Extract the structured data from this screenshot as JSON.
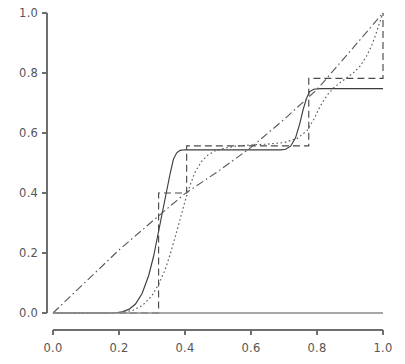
{
  "chart_data": {
    "type": "line",
    "title": "",
    "xlabel": "",
    "ylabel": "",
    "xlim": [
      0.0,
      1.0
    ],
    "ylim": [
      0.0,
      1.0
    ],
    "grid": false,
    "legend": "none",
    "xticks": [
      "0.0",
      "0.2",
      "0.4",
      "0.6",
      "0.8",
      "1.0"
    ],
    "xtick_values": [
      0.0,
      0.2,
      0.4,
      0.6,
      0.8,
      1.0
    ],
    "yticks": [
      "0.0",
      "0.2",
      "0.4",
      "0.6",
      "0.8",
      "1.0"
    ],
    "ytick_values": [
      0.0,
      0.2,
      0.4,
      0.6,
      0.8,
      1.0
    ],
    "series": [
      {
        "name": "smoothed-step-curve",
        "style": "solid",
        "color": "#3c3c3c",
        "points": [
          [
            0.0,
            0.0
          ],
          [
            0.05,
            0.0
          ],
          [
            0.1,
            0.0
          ],
          [
            0.15,
            0.0
          ],
          [
            0.19,
            0.001
          ],
          [
            0.21,
            0.004
          ],
          [
            0.23,
            0.012
          ],
          [
            0.25,
            0.03
          ],
          [
            0.27,
            0.065
          ],
          [
            0.29,
            0.125
          ],
          [
            0.305,
            0.19
          ],
          [
            0.315,
            0.245
          ],
          [
            0.325,
            0.3
          ],
          [
            0.335,
            0.355
          ],
          [
            0.345,
            0.41
          ],
          [
            0.355,
            0.465
          ],
          [
            0.365,
            0.513
          ],
          [
            0.375,
            0.534
          ],
          [
            0.385,
            0.542
          ],
          [
            0.4,
            0.544
          ],
          [
            0.45,
            0.544
          ],
          [
            0.5,
            0.544
          ],
          [
            0.55,
            0.544
          ],
          [
            0.6,
            0.544
          ],
          [
            0.65,
            0.544
          ],
          [
            0.69,
            0.544
          ],
          [
            0.705,
            0.546
          ],
          [
            0.72,
            0.556
          ],
          [
            0.735,
            0.584
          ],
          [
            0.748,
            0.632
          ],
          [
            0.758,
            0.678
          ],
          [
            0.768,
            0.715
          ],
          [
            0.778,
            0.738
          ],
          [
            0.79,
            0.746
          ],
          [
            0.81,
            0.748
          ],
          [
            0.85,
            0.748
          ],
          [
            0.9,
            0.748
          ],
          [
            0.95,
            0.748
          ],
          [
            1.0,
            0.748
          ]
        ]
      },
      {
        "name": "empirical-step-function",
        "style": "dashed",
        "color": "#4a4a4a",
        "points": [
          [
            0.2,
            0.0
          ],
          [
            0.32,
            0.0
          ],
          [
            0.32,
            0.4
          ],
          [
            0.405,
            0.4
          ],
          [
            0.405,
            0.557
          ],
          [
            0.775,
            0.557
          ],
          [
            0.775,
            0.782
          ],
          [
            1.0,
            0.782
          ],
          [
            1.0,
            1.0
          ]
        ]
      },
      {
        "name": "dotted-smooth-curve",
        "style": "dotted",
        "color": "#5a5a5a",
        "points": [
          [
            0.0,
            0.0
          ],
          [
            0.1,
            0.0
          ],
          [
            0.18,
            0.0
          ],
          [
            0.21,
            0.002
          ],
          [
            0.24,
            0.008
          ],
          [
            0.27,
            0.024
          ],
          [
            0.3,
            0.058
          ],
          [
            0.32,
            0.095
          ],
          [
            0.34,
            0.145
          ],
          [
            0.355,
            0.195
          ],
          [
            0.37,
            0.252
          ],
          [
            0.385,
            0.312
          ],
          [
            0.4,
            0.372
          ],
          [
            0.415,
            0.425
          ],
          [
            0.43,
            0.468
          ],
          [
            0.45,
            0.505
          ],
          [
            0.47,
            0.527
          ],
          [
            0.49,
            0.54
          ],
          [
            0.52,
            0.55
          ],
          [
            0.56,
            0.557
          ],
          [
            0.6,
            0.56
          ],
          [
            0.65,
            0.563
          ],
          [
            0.7,
            0.568
          ],
          [
            0.74,
            0.582
          ],
          [
            0.77,
            0.608
          ],
          [
            0.79,
            0.645
          ],
          [
            0.81,
            0.69
          ],
          [
            0.83,
            0.725
          ],
          [
            0.85,
            0.75
          ],
          [
            0.87,
            0.768
          ],
          [
            0.89,
            0.784
          ],
          [
            0.91,
            0.8
          ],
          [
            0.93,
            0.822
          ],
          [
            0.95,
            0.856
          ],
          [
            0.965,
            0.89
          ],
          [
            0.978,
            0.928
          ],
          [
            0.988,
            0.962
          ],
          [
            1.0,
            1.0
          ]
        ]
      },
      {
        "name": "diagonal-reference-line",
        "style": "dashdot",
        "color": "#5a5a5a",
        "points": [
          [
            0.0,
            0.0
          ],
          [
            0.1,
            0.105
          ],
          [
            0.2,
            0.21
          ],
          [
            0.3,
            0.305
          ],
          [
            0.4,
            0.398
          ],
          [
            0.5,
            0.472
          ],
          [
            0.6,
            0.552
          ],
          [
            0.7,
            0.645
          ],
          [
            0.8,
            0.745
          ],
          [
            0.9,
            0.872
          ],
          [
            1.0,
            1.0
          ]
        ]
      },
      {
        "name": "baseline-zero-line",
        "style": "solid",
        "color": "#8a8a8a",
        "points": [
          [
            0.0,
            0.0
          ],
          [
            1.0,
            0.0
          ]
        ]
      }
    ]
  },
  "axes": {
    "x_axis_name": "x-axis",
    "y_axis_name": "y-axis"
  }
}
